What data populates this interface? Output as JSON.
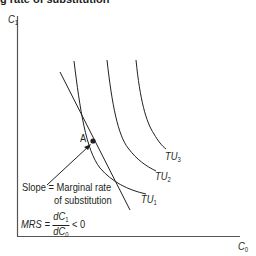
{
  "title": "g rate of substitution",
  "axes": {
    "y_label": "C",
    "y_label_sub": "1",
    "x_label": "C",
    "x_label_sub": "0"
  },
  "curves": [
    {
      "label": "TU",
      "sub": "1"
    },
    {
      "label": "TU",
      "sub": "2"
    },
    {
      "label": "TU",
      "sub": "3"
    }
  ],
  "point": {
    "label": "A"
  },
  "annotation": {
    "line1": "Slope = Marginal rate",
    "line2": "of substitution",
    "mrs_label": "MRS =",
    "num": "dC",
    "num_sub": "1",
    "den": "dC",
    "den_sub": "0",
    "inequality": "< 0"
  },
  "colors": {
    "ink": "#231f20",
    "axis": "#555555"
  }
}
